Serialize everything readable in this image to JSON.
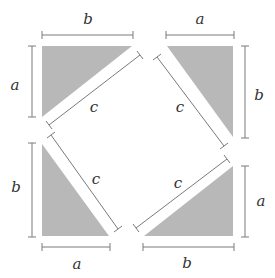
{
  "diagram": {
    "colors": {
      "triangle_fill": "#b8b8b8",
      "dimension_line": "#7a7a7a",
      "label": "#333333",
      "background": "#ffffff"
    },
    "labels": {
      "tl_top": "b",
      "tl_left": "a",
      "tl_hyp": "c",
      "tr_top": "a",
      "tr_right": "b",
      "tr_hyp": "c",
      "bl_left": "b",
      "bl_bottom": "a",
      "bl_hyp": "c",
      "br_right": "a",
      "br_bottom": "b",
      "br_hyp": "c"
    },
    "triangles": [
      {
        "name": "top-left",
        "legs": [
          "a",
          "b"
        ],
        "hypotenuse": "c"
      },
      {
        "name": "top-right",
        "legs": [
          "a",
          "b"
        ],
        "hypotenuse": "c"
      },
      {
        "name": "bottom-left",
        "legs": [
          "b",
          "a"
        ],
        "hypotenuse": "c"
      },
      {
        "name": "bottom-right",
        "legs": [
          "a",
          "b"
        ],
        "hypotenuse": "c"
      }
    ]
  }
}
